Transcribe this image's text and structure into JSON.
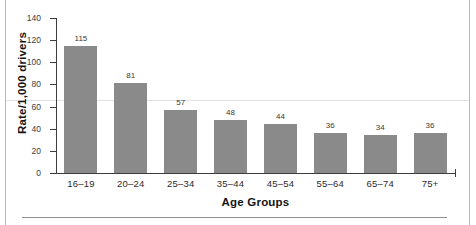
{
  "chart_data": {
    "type": "bar",
    "title": "",
    "subtitle": "",
    "categories": [
      "16–19",
      "20–24",
      "25–34",
      "35–44",
      "45–54",
      "55–64",
      "65–74",
      "75+"
    ],
    "values": [
      115,
      81,
      57,
      48,
      44,
      36,
      34,
      36
    ],
    "value_labels": [
      "115",
      "81",
      "57",
      "48",
      "44",
      "36",
      "34",
      "36"
    ],
    "xlabel": "Age Groups",
    "ylabel": "Rate/1,000 drivers",
    "ylim": [
      0,
      140
    ],
    "yticks": [
      140,
      120,
      100,
      80,
      60,
      40,
      20,
      0
    ],
    "ytick_labels": [
      "140",
      "120",
      "100",
      "80",
      "60",
      "40",
      "20",
      "0"
    ],
    "grid": false,
    "legend": false,
    "legend_position": "none",
    "bar_color": "#8a8a8a",
    "axis_color": "#3d3d3d",
    "background": "#ffffff"
  }
}
